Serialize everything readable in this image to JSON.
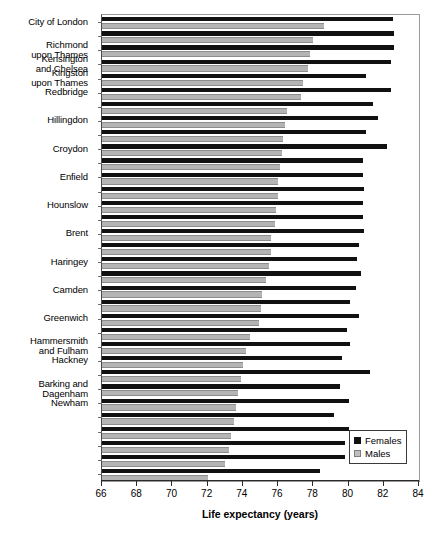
{
  "chart_data": {
    "type": "bar",
    "orientation": "horizontal",
    "title": "",
    "xlabel": "Life expectancy (years)",
    "ylabel": "",
    "xlim": [
      66,
      84
    ],
    "xticks": [
      66,
      68,
      70,
      72,
      74,
      76,
      78,
      80,
      82,
      84
    ],
    "grid": false,
    "legend_position": "bottom-right",
    "legend": [
      "Females",
      "Males"
    ],
    "colors": {
      "Females": "#111111",
      "Males": "#b4b4b4"
    },
    "categories": [
      "City of London",
      "",
      "Richmond upon Thames",
      "Kensington and Chelsea",
      "Kingston upon Thames",
      "Redbridge",
      "",
      "Hillingdon",
      "",
      "Croydon",
      "",
      "Enfield",
      "",
      "Hounslow",
      "",
      "Brent",
      "",
      "Haringey",
      "",
      "Camden",
      "",
      "Greenwich",
      "",
      "Hammersmith and Fulham",
      "Hackney",
      "",
      "Barking and Dagenham",
      "Newham",
      "",
      "",
      "",
      "",
      ""
    ],
    "categories_display": [
      "City of London",
      "Richmond\nupon Thames",
      "Kensington\nand Chelsea",
      "Kingston\nupon Thames",
      "Redbridge",
      "Hillingdon",
      "Croydon",
      "Enfield",
      "Hounslow",
      "Brent",
      "Haringey",
      "Camden",
      "Greenwich",
      "Hammersmith\nand Fulham",
      "Hackney",
      "Barking and\nDagenham",
      "Newham"
    ],
    "series": [
      {
        "name": "Females",
        "values": [
          82.5,
          82.6,
          82.6,
          82.4,
          81.0,
          82.4,
          81.4,
          81.7,
          81.0,
          82.2,
          80.8,
          80.8,
          80.9,
          80.8,
          80.8,
          80.9,
          80.6,
          80.5,
          80.7,
          80.4,
          80.1,
          80.6,
          79.9,
          80.1,
          79.6,
          81.2,
          79.5,
          80.0,
          79.2,
          80.0,
          79.8,
          79.8,
          78.4
        ]
      },
      {
        "name": "Males",
        "values": [
          78.6,
          78.0,
          77.8,
          77.7,
          77.4,
          77.3,
          76.5,
          76.4,
          76.3,
          76.2,
          76.1,
          76.0,
          76.0,
          75.9,
          75.8,
          75.6,
          75.6,
          75.5,
          75.3,
          75.1,
          75.0,
          74.9,
          74.4,
          74.2,
          74.0,
          73.9,
          73.7,
          73.6,
          73.5,
          73.3,
          73.2,
          73.0,
          72.0
        ]
      }
    ],
    "rows": [
      {
        "label": "City of London",
        "label_lines": "City of London",
        "female": 82.5,
        "male": 78.6
      },
      {
        "label": "",
        "label_lines": "",
        "female": 82.6,
        "male": 78.0
      },
      {
        "label": "Richmond upon Thames",
        "label_lines": "Richmond\nupon Thames",
        "female": 82.6,
        "male": 77.8
      },
      {
        "label": "Kensington and Chelsea",
        "label_lines": "Kensington\nand Chelsea",
        "female": 82.4,
        "male": 77.7
      },
      {
        "label": "Kingston upon Thames",
        "label_lines": "Kingston\nupon Thames",
        "female": 81.0,
        "male": 77.4
      },
      {
        "label": "Redbridge",
        "label_lines": "Redbridge",
        "female": 82.4,
        "male": 77.3
      },
      {
        "label": "",
        "label_lines": "",
        "female": 81.4,
        "male": 76.5
      },
      {
        "label": "Hillingdon",
        "label_lines": "Hillingdon",
        "female": 81.7,
        "male": 76.4
      },
      {
        "label": "",
        "label_lines": "",
        "female": 81.0,
        "male": 76.3
      },
      {
        "label": "Croydon",
        "label_lines": "Croydon",
        "female": 82.2,
        "male": 76.2
      },
      {
        "label": "",
        "label_lines": "",
        "female": 80.8,
        "male": 76.1
      },
      {
        "label": "Enfield",
        "label_lines": "Enfield",
        "female": 80.8,
        "male": 76.0
      },
      {
        "label": "",
        "label_lines": "",
        "female": 80.9,
        "male": 76.0
      },
      {
        "label": "Hounslow",
        "label_lines": "Hounslow",
        "female": 80.8,
        "male": 75.9
      },
      {
        "label": "",
        "label_lines": "",
        "female": 80.8,
        "male": 75.8
      },
      {
        "label": "Brent",
        "label_lines": "Brent",
        "female": 80.9,
        "male": 75.6
      },
      {
        "label": "",
        "label_lines": "",
        "female": 80.6,
        "male": 75.6
      },
      {
        "label": "Haringey",
        "label_lines": "Haringey",
        "female": 80.5,
        "male": 75.5
      },
      {
        "label": "",
        "label_lines": "",
        "female": 80.7,
        "male": 75.3
      },
      {
        "label": "Camden",
        "label_lines": "Camden",
        "female": 80.4,
        "male": 75.1
      },
      {
        "label": "",
        "label_lines": "",
        "female": 80.1,
        "male": 75.0
      },
      {
        "label": "Greenwich",
        "label_lines": "Greenwich",
        "female": 80.6,
        "male": 74.9
      },
      {
        "label": "",
        "label_lines": "",
        "female": 79.9,
        "male": 74.4
      },
      {
        "label": "Hammersmith and Fulham",
        "label_lines": "Hammersmith\nand Fulham",
        "female": 80.1,
        "male": 74.2
      },
      {
        "label": "Hackney",
        "label_lines": "Hackney",
        "female": 79.6,
        "male": 74.0
      },
      {
        "label": "",
        "label_lines": "",
        "female": 81.2,
        "male": 73.9
      },
      {
        "label": "Barking and Dagenham",
        "label_lines": "Barking and\nDagenham",
        "female": 79.5,
        "male": 73.7
      },
      {
        "label": "Newham",
        "label_lines": "Newham",
        "female": 80.0,
        "male": 73.6
      },
      {
        "label": "",
        "label_lines": "",
        "female": 79.2,
        "male": 73.5
      },
      {
        "label": "",
        "label_lines": "",
        "female": 80.0,
        "male": 73.3
      },
      {
        "label": "",
        "label_lines": "",
        "female": 79.8,
        "male": 73.2
      },
      {
        "label": "",
        "label_lines": "",
        "female": 79.8,
        "male": 73.0
      },
      {
        "label": "",
        "label_lines": "",
        "female": 78.4,
        "male": 72.0
      }
    ]
  },
  "axis": {
    "x_title": "Life expectancy (years)",
    "tick_labels": [
      "66",
      "68",
      "70",
      "72",
      "74",
      "76",
      "78",
      "80",
      "82",
      "84"
    ]
  },
  "legend": {
    "females_label": "Females",
    "males_label": "Males"
  }
}
